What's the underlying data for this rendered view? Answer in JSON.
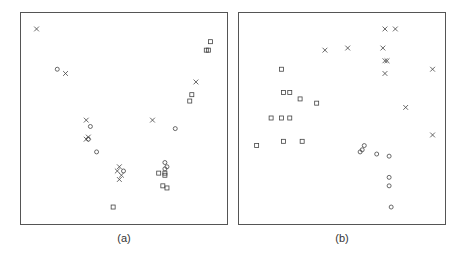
{
  "chart_data": [
    {
      "type": "scatter",
      "title": "",
      "caption": "(a)",
      "xlabel": "",
      "ylabel": "",
      "xlim": [
        0,
        100
      ],
      "ylim": [
        0,
        100
      ],
      "grid": false,
      "axes_ticks": false,
      "series": [
        {
          "name": "cross",
          "marker": "x",
          "points": [
            [
              8,
              92
            ],
            [
              22,
              71
            ],
            [
              32,
              49
            ],
            [
              32,
              40
            ],
            [
              33,
              41
            ],
            [
              48,
              27
            ],
            [
              47,
              25
            ],
            [
              49,
              23
            ],
            [
              48,
              21
            ],
            [
              64,
              49
            ],
            [
              85,
              67
            ]
          ]
        },
        {
          "name": "circle",
          "marker": "o",
          "points": [
            [
              18,
              73
            ],
            [
              34,
              46
            ],
            [
              37,
              34
            ],
            [
              33,
              40
            ],
            [
              50,
              25
            ],
            [
              75,
              45
            ],
            [
              70,
              29
            ],
            [
              71,
              27
            ],
            [
              70,
              26
            ]
          ]
        },
        {
          "name": "square",
          "marker": "s",
          "points": [
            [
              92,
              86
            ],
            [
              91,
              82
            ],
            [
              90,
              82
            ],
            [
              83,
              61
            ],
            [
              82,
              58
            ],
            [
              45,
              8
            ],
            [
              67,
              24
            ],
            [
              70,
              24
            ],
            [
              69,
              18
            ],
            [
              71,
              17
            ],
            [
              70,
              23
            ]
          ]
        }
      ]
    },
    {
      "type": "scatter",
      "title": "",
      "caption": "(b)",
      "xlabel": "",
      "ylabel": "",
      "xlim": [
        0,
        100
      ],
      "ylim": [
        0,
        100
      ],
      "grid": false,
      "axes_ticks": false,
      "series": [
        {
          "name": "cross",
          "marker": "x",
          "points": [
            [
              71,
              92
            ],
            [
              76,
              92
            ],
            [
              42,
              82
            ],
            [
              53,
              83
            ],
            [
              70,
              83
            ],
            [
              71,
              77
            ],
            [
              72,
              77
            ],
            [
              71,
              71
            ],
            [
              94,
              73
            ],
            [
              81,
              55
            ],
            [
              94,
              42
            ]
          ]
        },
        {
          "name": "circle",
          "marker": "o",
          "points": [
            [
              60,
              35
            ],
            [
              61,
              37
            ],
            [
              59,
              34
            ],
            [
              67,
              33
            ],
            [
              73,
              32
            ],
            [
              73,
              22
            ],
            [
              73,
              18
            ],
            [
              74,
              8
            ]
          ]
        },
        {
          "name": "square",
          "marker": "s",
          "points": [
            [
              21,
              73
            ],
            [
              22,
              62
            ],
            [
              25,
              62
            ],
            [
              30,
              59
            ],
            [
              38,
              57
            ],
            [
              16,
              50
            ],
            [
              21,
              50
            ],
            [
              25,
              50
            ],
            [
              9,
              37
            ],
            [
              22,
              39
            ],
            [
              31,
              39
            ]
          ]
        }
      ]
    }
  ]
}
